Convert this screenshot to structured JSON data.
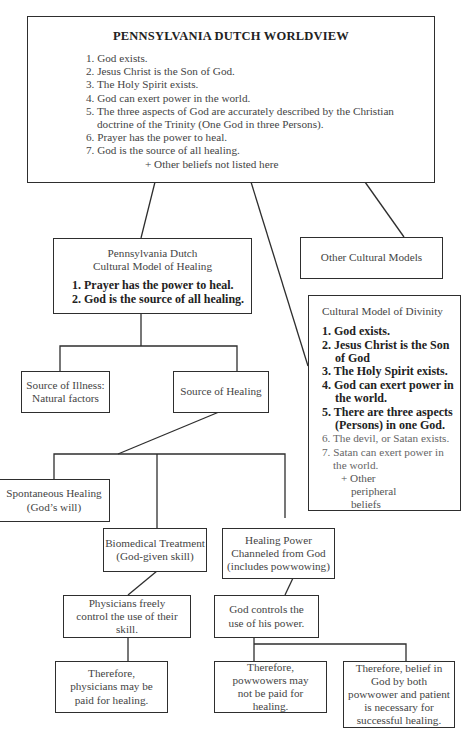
{
  "worldview": {
    "title": "PENNSYLVANIA DUTCH WORLDVIEW",
    "items": [
      "1. God exists.",
      "2. Jesus Christ is the Son of God.",
      "3. The Holy Spirit exists.",
      "4. God can exert power in the world.",
      "5. The three aspects of God are accurately described by the Christian doctrine of the Trinity (One God in three Persons).",
      "6. Prayer has the power to heal.",
      "7. God is the source of all healing."
    ],
    "footer": "+ Other beliefs not listed here"
  },
  "healing_model": {
    "title_line1": "Pennsylvania Dutch",
    "title_line2": "Cultural Model of Healing",
    "items": [
      "1. Prayer has the power to heal.",
      "2. God is the source of all healing."
    ]
  },
  "other_models": {
    "label": "Other Cultural Models"
  },
  "divinity_model": {
    "title": "Cultural Model of Divinity",
    "core_items": [
      "1. God exists.",
      "2. Jesus Christ is the Son of God",
      "3. The Holy Spirit exists.",
      "4. God can exert power in the world.",
      "5. There are three aspects (Persons) in one God."
    ],
    "peripheral_items": [
      "6. The devil, or Satan exists.",
      "7. Satan can exert power in the world."
    ],
    "footer": "+ Other peripheral beliefs"
  },
  "source_illness": {
    "line1": "Source of Illness:",
    "line2": "Natural factors"
  },
  "source_healing": {
    "label": "Source of Healing"
  },
  "spontaneous": {
    "line1": "Spontaneous Healing",
    "line2": "(God’s will)"
  },
  "biomedical": {
    "line1": "Biomedical Treatment",
    "line2": "(God-given skill)"
  },
  "channeled": {
    "line1": "Healing Power",
    "line2": "Channeled from God",
    "line3": "(includes powwowing)"
  },
  "physicians_control": {
    "text": "Physicians freely control the use of their skill."
  },
  "god_controls": {
    "text": "God controls the use of his power."
  },
  "physicians_paid": {
    "text": "Therefore, physicians may be paid for healing."
  },
  "powwowers_not_paid": {
    "text": "Therefore, powwowers may not be paid for healing."
  },
  "belief_necessary": {
    "text": "Therefore, belief in God by both powwower and patient is necessary for successful healing."
  }
}
